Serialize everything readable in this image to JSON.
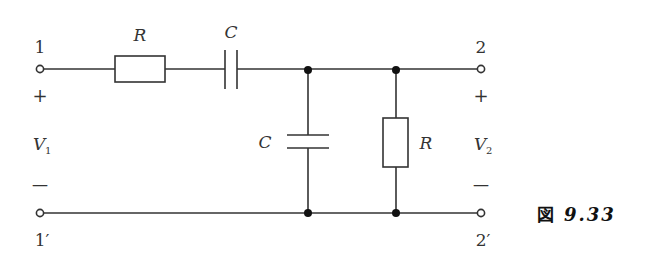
{
  "diagram": {
    "type": "circuit",
    "colors": {
      "wire": "#333333",
      "background": "#ffffff",
      "text": "#333333"
    },
    "terminals": {
      "in_top": {
        "label": "1",
        "polarity": "+"
      },
      "in_bottom": {
        "label": "1′",
        "polarity": "—"
      },
      "out_top": {
        "label": "2",
        "polarity": "+"
      },
      "out_bottom": {
        "label": "2′",
        "polarity": "—"
      }
    },
    "voltages": {
      "input": {
        "symbol": "V",
        "subscript": "1"
      },
      "output": {
        "symbol": "V",
        "subscript": "2"
      }
    },
    "components": [
      {
        "id": "series-resistor",
        "symbol": "R",
        "orientation": "horizontal",
        "placement": "series"
      },
      {
        "id": "series-capacitor",
        "symbol": "C",
        "orientation": "horizontal",
        "placement": "series"
      },
      {
        "id": "shunt-capacitor",
        "symbol": "C",
        "orientation": "vertical",
        "placement": "shunt"
      },
      {
        "id": "shunt-resistor",
        "symbol": "R",
        "orientation": "vertical",
        "placement": "shunt"
      }
    ]
  },
  "caption": {
    "prefix": "図",
    "number": "9.33"
  }
}
